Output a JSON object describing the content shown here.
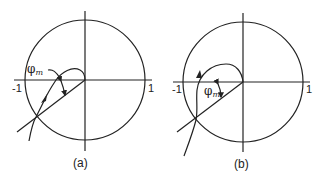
{
  "figure": {
    "panels": [
      {
        "id": "a",
        "caption": "(a)",
        "axis_labels": {
          "left": "-1",
          "right": "1"
        },
        "angle_label": {
          "symbol": "φ",
          "subscript": "m"
        },
        "unit_circle": {
          "cx": 85,
          "cy": 80,
          "r": 60
        }
      },
      {
        "id": "b",
        "caption": "(b)",
        "axis_labels": {
          "left": "-1",
          "right": "1"
        },
        "angle_label": {
          "symbol": "φ",
          "subscript": "m"
        },
        "unit_circle": {
          "cx": 243,
          "cy": 82,
          "r": 60
        }
      }
    ]
  }
}
